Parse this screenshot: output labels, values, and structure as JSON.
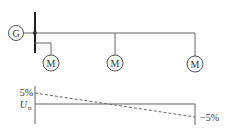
{
  "diagram": {
    "type": "power-distribution-voltage-profile",
    "generator": {
      "label": "G"
    },
    "motors": [
      {
        "label": "M"
      },
      {
        "label": "M"
      },
      {
        "label": "M"
      }
    ],
    "voltage_profile": {
      "top_label": "5%",
      "nominal_label_main": "U",
      "nominal_label_sub": "n",
      "end_label": "−5%"
    },
    "colors": {
      "line": "#666666",
      "bus": "#222222",
      "text": "#333333"
    }
  }
}
